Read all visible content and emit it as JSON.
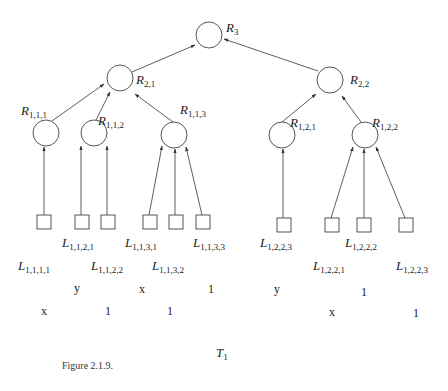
{
  "diagram": {
    "type": "tree",
    "tree_name": "T",
    "tree_subscript": "1",
    "caption": "Figure 2.1.9.",
    "root": {
      "id": "R3",
      "letter": "R",
      "sub": "3",
      "x": 209,
      "y": 35
    },
    "internal_nodes": [
      {
        "id": "R21",
        "letter": "R",
        "sub": "2,1",
        "x": 120,
        "y": 78,
        "parent": "R3"
      },
      {
        "id": "R22",
        "letter": "R",
        "sub": "2,2",
        "x": 330,
        "y": 80,
        "parent": "R3"
      },
      {
        "id": "R111",
        "letter": "R",
        "sub": "1,1,1",
        "x": 46,
        "y": 133,
        "parent": "R21"
      },
      {
        "id": "R112",
        "letter": "R",
        "sub": "1,1,2",
        "x": 94,
        "y": 133,
        "parent": "R21"
      },
      {
        "id": "R113",
        "letter": "R",
        "sub": "1,1,3",
        "x": 174,
        "y": 135,
        "parent": "R21"
      },
      {
        "id": "R121",
        "letter": "R",
        "sub": "1,2,1",
        "x": 282,
        "y": 135,
        "parent": "R22"
      },
      {
        "id": "R122",
        "letter": "R",
        "sub": "1,2,2",
        "x": 365,
        "y": 135,
        "parent": "R22"
      }
    ],
    "leaves": [
      {
        "id": "L1111",
        "letter": "L",
        "sub": "1,1,1,1",
        "value": "x",
        "x": 43,
        "y": 222,
        "parent": "R111"
      },
      {
        "id": "L1121",
        "letter": "L",
        "sub": "1,1,2,1",
        "value": "y",
        "x": 82,
        "y": 222,
        "parent": "R112"
      },
      {
        "id": "L1122",
        "letter": "L",
        "sub": "1,1,2,2",
        "value": "1",
        "x": 108,
        "y": 222,
        "parent": "R112"
      },
      {
        "id": "L1131",
        "letter": "L",
        "sub": "1,1,3,1",
        "value": "x",
        "x": 150,
        "y": 222,
        "parent": "R113"
      },
      {
        "id": "L1132",
        "letter": "L",
        "sub": "1,1,3,2",
        "value": "1",
        "x": 176,
        "y": 222,
        "parent": "R113"
      },
      {
        "id": "L1133",
        "letter": "L",
        "sub": "1,1,3,3",
        "value": "1",
        "x": 203,
        "y": 222,
        "parent": "R113"
      },
      {
        "id": "L1223",
        "letter": "L",
        "sub": "1,2,2,3",
        "value": "y",
        "x": 284,
        "y": 225,
        "parent": "R121"
      },
      {
        "id": "L1221",
        "letter": "L",
        "sub": "1,2,2,1",
        "value": "x",
        "x": 332,
        "y": 225,
        "parent": "R122"
      },
      {
        "id": "L1222",
        "letter": "L",
        "sub": "1,2,2,2",
        "value": "1",
        "x": 364,
        "y": 225,
        "parent": "R122"
      },
      {
        "id": "L1223b",
        "letter": "L",
        "sub": "1,2,2,3",
        "value": "1",
        "x": 406,
        "y": 225,
        "parent": "R122"
      }
    ]
  },
  "labels": {
    "R3": {
      "letter": "R",
      "sub": "3"
    },
    "R21": {
      "letter": "R",
      "sub": "2,1"
    },
    "R22": {
      "letter": "R",
      "sub": "2,2"
    },
    "R111": {
      "letter": "R",
      "sub": "1,1,1"
    },
    "R112": {
      "letter": "R",
      "sub": "1,1,2"
    },
    "R113": {
      "letter": "R",
      "sub": "1,1,3"
    },
    "R121": {
      "letter": "R",
      "sub": "1,2,1"
    },
    "R122": {
      "letter": "R",
      "sub": "1,2,2"
    },
    "L1111": {
      "letter": "L",
      "sub": "1,1,1,1",
      "value": "x"
    },
    "L1121": {
      "letter": "L",
      "sub": "1,1,2,1",
      "value": "y"
    },
    "L1122": {
      "letter": "L",
      "sub": "1,1,2,2",
      "value": "1"
    },
    "L1131": {
      "letter": "L",
      "sub": "1,1,3,1",
      "value": "x"
    },
    "L1132": {
      "letter": "L",
      "sub": "1,1,3,2",
      "value": "1"
    },
    "L1133": {
      "letter": "L",
      "sub": "1,1,3,3",
      "value": "1"
    },
    "L1223": {
      "letter": "L",
      "sub": "1,2,2,3",
      "value": "y"
    },
    "L1222": {
      "letter": "L",
      "sub": "1,2,2,2",
      "value": "1"
    },
    "L1221": {
      "letter": "L",
      "sub": "1,2,2,1",
      "value": "x"
    },
    "L1223b": {
      "letter": "L",
      "sub": "1,2,2,3",
      "value": "1"
    }
  },
  "footer": {
    "tree_letter": "T",
    "tree_sub": "1",
    "caption": "Figure 2.1.9."
  }
}
